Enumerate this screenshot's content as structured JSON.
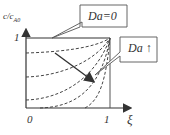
{
  "diagram": {
    "y_axis_label": "c/c",
    "y_axis_label_sub": "A0",
    "y_tick_one": "1",
    "x_tick_zero": "0",
    "x_tick_one": "1",
    "x_axis_label": "ξ",
    "callout_top": "Da=0",
    "callout_right": "Da ↑",
    "colors": {
      "line": "#333333",
      "background": "#ffffff"
    }
  }
}
